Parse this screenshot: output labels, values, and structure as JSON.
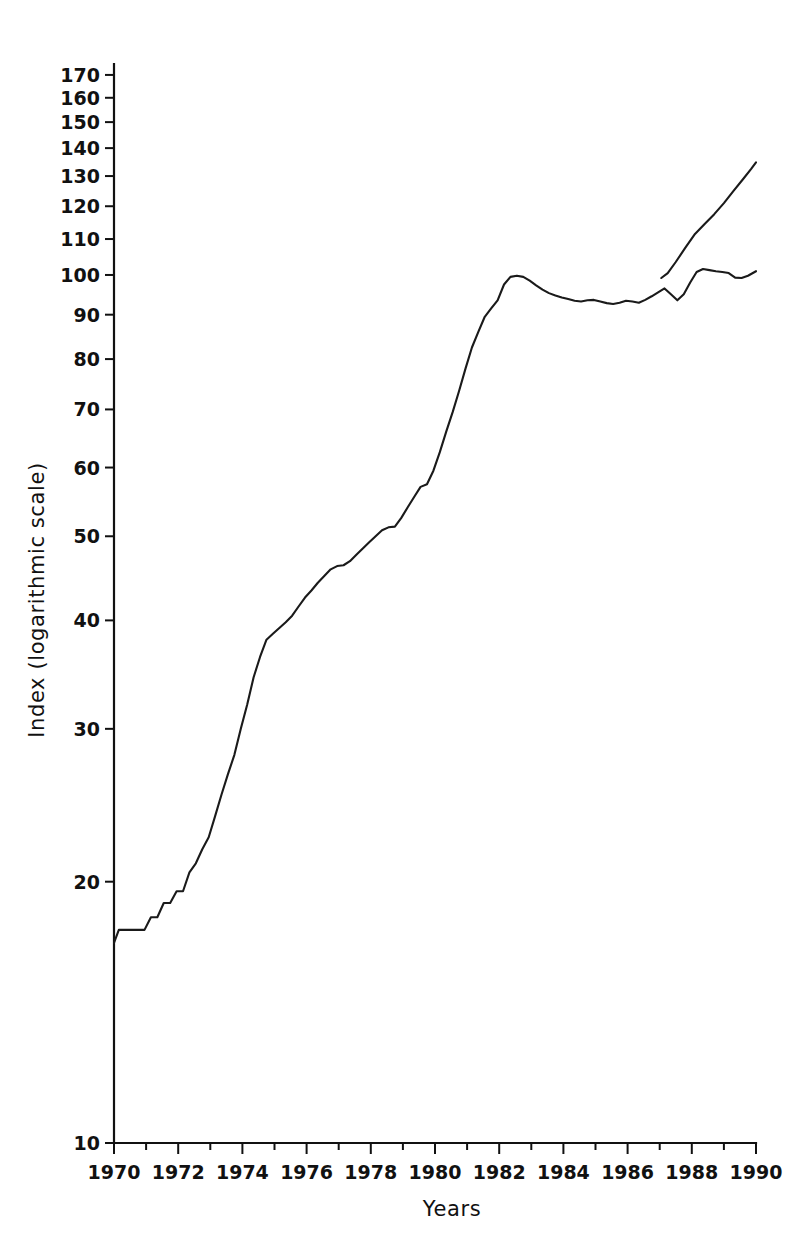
{
  "chart_data": {
    "type": "line",
    "title": "",
    "xlabel": "Years",
    "ylabel": "Index (logarithmic scale)",
    "yscale": "log",
    "ylim": [
      10,
      175
    ],
    "xlim": [
      1970,
      1990
    ],
    "grid": false,
    "legend": false,
    "y_ticks": [
      10,
      20,
      30,
      40,
      50,
      60,
      70,
      80,
      90,
      100,
      110,
      120,
      130,
      140,
      150,
      160,
      170
    ],
    "y_tick_labels": [
      "10",
      "20",
      "30",
      "40",
      "50",
      "60",
      "70",
      "80",
      "90",
      "100",
      "110",
      "120",
      "130",
      "140",
      "150",
      "160",
      "170"
    ],
    "x_ticks": [
      1970,
      1972,
      1974,
      1976,
      1978,
      1980,
      1982,
      1984,
      1986,
      1988,
      1990
    ],
    "x_tick_labels": [
      "1970",
      "1972",
      "1974",
      "1976",
      "1978",
      "1980",
      "1982",
      "1984",
      "1986",
      "1988",
      "1990"
    ],
    "x_minor_ticks": [
      1971,
      1973,
      1975,
      1977,
      1979,
      1981,
      1983,
      1985,
      1987,
      1989
    ],
    "series": [
      {
        "name": "Index",
        "color": "#1a1a1a",
        "x": [
          1970.0,
          1970.15,
          1970.35,
          1970.55,
          1970.75,
          1970.95,
          1971.15,
          1971.35,
          1971.55,
          1971.75,
          1971.95,
          1972.15,
          1972.35,
          1972.55,
          1972.75,
          1972.95,
          1973.15,
          1973.35,
          1973.55,
          1973.75,
          1973.95,
          1974.15,
          1974.35,
          1974.55,
          1974.75,
          1974.95,
          1975.15,
          1975.35,
          1975.55,
          1975.75,
          1975.95,
          1976.15,
          1976.35,
          1976.55,
          1976.75,
          1976.95,
          1977.15,
          1977.35,
          1977.55,
          1977.75,
          1977.95,
          1978.15,
          1978.35,
          1978.55,
          1978.75,
          1978.95,
          1979.15,
          1979.35,
          1979.55,
          1979.75,
          1979.95,
          1980.15,
          1980.35,
          1980.55,
          1980.75,
          1980.95,
          1981.15,
          1981.35,
          1981.55,
          1981.75,
          1981.95,
          1982.15,
          1982.35,
          1982.55,
          1982.75,
          1982.95,
          1983.15,
          1983.35,
          1983.55,
          1983.75,
          1983.95,
          1984.15,
          1984.35,
          1984.55,
          1984.75,
          1984.95,
          1985.15,
          1985.35,
          1985.55,
          1985.75,
          1985.95,
          1986.15,
          1986.35,
          1986.55,
          1986.75,
          1986.95,
          1987.15,
          1987.35,
          1987.55,
          1987.75,
          1987.95,
          1988.15,
          1988.35,
          1988.55,
          1988.75,
          1988.95,
          1989.15,
          1989.35,
          1989.55,
          1989.75,
          1990.0
        ],
        "y": [
          17.0,
          17.6,
          17.6,
          17.6,
          17.6,
          17.6,
          18.2,
          18.2,
          18.9,
          18.9,
          19.5,
          19.5,
          20.5,
          21.0,
          21.8,
          22.5,
          23.8,
          25.2,
          26.6,
          28.0,
          30.0,
          32.0,
          34.4,
          36.3,
          38.0,
          38.6,
          39.2,
          39.8,
          40.5,
          41.5,
          42.5,
          43.3,
          44.2,
          45.0,
          45.8,
          46.2,
          46.3,
          46.8,
          47.6,
          48.4,
          49.2,
          50.0,
          50.8,
          51.2,
          51.3,
          52.5,
          54.0,
          55.5,
          57.0,
          57.4,
          59.5,
          62.5,
          66.0,
          69.5,
          73.5,
          78.0,
          82.5,
          86.0,
          89.5,
          91.5,
          93.5,
          97.5,
          99.5,
          99.8,
          99.5,
          98.5,
          97.3,
          96.2,
          95.3,
          94.7,
          94.2,
          93.8,
          93.4,
          93.2,
          93.5,
          93.6,
          93.2,
          92.8,
          92.6,
          92.9,
          93.4,
          93.2,
          92.9,
          93.6,
          94.5,
          95.5,
          96.5,
          95.0,
          93.5,
          95.0,
          98.0,
          100.8,
          101.6,
          101.3,
          101.0,
          100.8,
          100.5,
          99.3,
          99.2,
          99.8,
          101.0
        ]
      },
      {
        "name": "Index-continued",
        "color": "#1a1a1a",
        "x": [
          1987.05,
          1987.25,
          1987.5,
          1987.8,
          1988.1,
          1988.4,
          1988.7,
          1989.0,
          1989.3,
          1989.6,
          1989.85,
          1990.0
        ],
        "y": [
          99.2,
          100.5,
          103.5,
          107.5,
          111.5,
          114.5,
          117.5,
          121.0,
          125.0,
          129.0,
          132.5,
          134.8
        ]
      }
    ]
  },
  "axes": {
    "y_axis_title": "Index (logarithmic scale)",
    "x_axis_title": "Years"
  }
}
